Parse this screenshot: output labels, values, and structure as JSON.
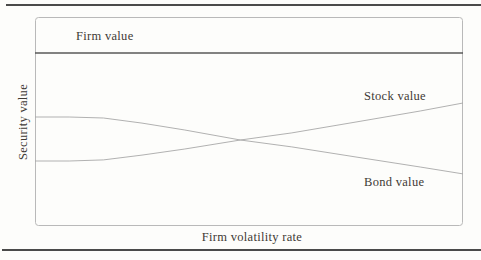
{
  "colors": {
    "background": "#fdfdfb",
    "horizontal_rule": "#4a4a4a",
    "plot_border": "#b9b9b9",
    "firm_value_line": "#595959",
    "curve_gray": "#a8a8a8",
    "text": "#3f3a35"
  },
  "chart_data": {
    "type": "line",
    "title": "",
    "xlabel": "Firm volatility rate",
    "ylabel": "Security value",
    "axis_ticks": "none",
    "grid": false,
    "legend": "inline-annotations",
    "x_range": [
      0,
      1
    ],
    "y_range": [
      0,
      1.15
    ],
    "x": [
      0,
      0.08,
      0.16,
      0.25,
      0.35,
      0.48,
      0.6,
      0.75,
      0.9,
      1.0
    ],
    "series": [
      {
        "name": "Firm value",
        "values": [
          1,
          1,
          1,
          1,
          1,
          1,
          1,
          1,
          1,
          1
        ],
        "color": "#595959",
        "stroke_width": 1.7
      },
      {
        "name": "Stock value",
        "values": [
          0.376,
          0.376,
          0.382,
          0.41,
          0.445,
          0.497,
          0.538,
          0.601,
          0.665,
          0.711
        ],
        "color": "#a8a8a8",
        "stroke_width": 0.9
      },
      {
        "name": "Bond value",
        "values": [
          0.63,
          0.63,
          0.624,
          0.595,
          0.555,
          0.497,
          0.457,
          0.399,
          0.341,
          0.301
        ],
        "color": "#a8a8a8",
        "stroke_width": 0.9
      }
    ]
  }
}
